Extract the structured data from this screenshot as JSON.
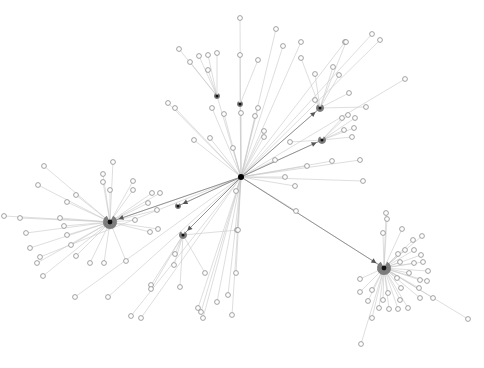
{
  "graph": {
    "title": "",
    "width": 484,
    "height": 368,
    "colors": {
      "background": "#ffffff",
      "edge": "#c8c8c8",
      "edge_strong": "#8a8a8a",
      "leaf_stroke": "#8c8c8c",
      "hub_pie": "#7c7c7c",
      "root": "#000000"
    },
    "root": {
      "id": "root",
      "x": 241,
      "y": 177,
      "r": 3
    },
    "hubs": [
      {
        "id": "hub-west",
        "x": 110,
        "y": 222,
        "r": 7
      },
      {
        "id": "hub-southeast",
        "x": 384,
        "y": 268,
        "r": 7
      },
      {
        "id": "hub-northeast-1",
        "x": 320,
        "y": 108,
        "r": 4
      },
      {
        "id": "hub-northeast-2",
        "x": 322,
        "y": 140,
        "r": 4
      },
      {
        "id": "hub-south-1",
        "x": 183,
        "y": 235,
        "r": 4
      },
      {
        "id": "hub-mid-west",
        "x": 178,
        "y": 206,
        "r": 3
      },
      {
        "id": "hub-north-1",
        "x": 217,
        "y": 96,
        "r": 3
      },
      {
        "id": "hub-north-2",
        "x": 240,
        "y": 104,
        "r": 3
      }
    ],
    "strong_edges": [
      {
        "from": "root",
        "to": "hub-west"
      },
      {
        "from": "root",
        "to": "hub-southeast"
      },
      {
        "from": "root",
        "to": "hub-northeast-1"
      },
      {
        "from": "root",
        "to": "hub-northeast-2"
      },
      {
        "from": "root",
        "to": "hub-south-1"
      },
      {
        "from": "root",
        "to": "hub-mid-west"
      }
    ],
    "leaves": [
      {
        "x": 240,
        "y": 18,
        "p": "root"
      },
      {
        "x": 276,
        "y": 29,
        "p": "root"
      },
      {
        "x": 345,
        "y": 42,
        "p": "root"
      },
      {
        "x": 372,
        "y": 34,
        "p": "root"
      },
      {
        "x": 380,
        "y": 40,
        "p": "root"
      },
      {
        "x": 179,
        "y": 49,
        "p": "hub-north-1"
      },
      {
        "x": 199,
        "y": 56,
        "p": "hub-north-1"
      },
      {
        "x": 208,
        "y": 55,
        "p": "hub-north-1"
      },
      {
        "x": 217,
        "y": 53,
        "p": "hub-north-1"
      },
      {
        "x": 240,
        "y": 55,
        "p": "hub-north-2"
      },
      {
        "x": 258,
        "y": 60,
        "p": "hub-north-2"
      },
      {
        "x": 190,
        "y": 62,
        "p": "hub-north-1"
      },
      {
        "x": 208,
        "y": 70,
        "p": "hub-north-1"
      },
      {
        "x": 346,
        "y": 42,
        "p": "hub-northeast-1"
      },
      {
        "x": 301,
        "y": 58,
        "p": "hub-northeast-1"
      },
      {
        "x": 315,
        "y": 74,
        "p": "hub-northeast-1"
      },
      {
        "x": 333,
        "y": 67,
        "p": "hub-northeast-1"
      },
      {
        "x": 339,
        "y": 75,
        "p": "hub-northeast-1"
      },
      {
        "x": 315,
        "y": 100,
        "p": "hub-northeast-1"
      },
      {
        "x": 349,
        "y": 93,
        "p": "hub-northeast-1"
      },
      {
        "x": 366,
        "y": 107,
        "p": "hub-northeast-1"
      },
      {
        "x": 348,
        "y": 115,
        "p": "hub-northeast-2"
      },
      {
        "x": 342,
        "y": 118,
        "p": "hub-northeast-2"
      },
      {
        "x": 355,
        "y": 118,
        "p": "hub-northeast-2"
      },
      {
        "x": 354,
        "y": 128,
        "p": "hub-northeast-2"
      },
      {
        "x": 344,
        "y": 130,
        "p": "hub-northeast-2"
      },
      {
        "x": 352,
        "y": 137,
        "p": "hub-northeast-2"
      },
      {
        "x": 290,
        "y": 142,
        "p": "hub-northeast-2"
      },
      {
        "x": 264,
        "y": 137,
        "p": "root"
      },
      {
        "x": 283,
        "y": 46,
        "p": "root"
      },
      {
        "x": 301,
        "y": 42,
        "p": "root"
      },
      {
        "x": 168,
        "y": 103,
        "p": "root"
      },
      {
        "x": 175,
        "y": 108,
        "p": "root"
      },
      {
        "x": 224,
        "y": 114,
        "p": "root"
      },
      {
        "x": 212,
        "y": 108,
        "p": "root"
      },
      {
        "x": 241,
        "y": 113,
        "p": "root"
      },
      {
        "x": 255,
        "y": 116,
        "p": "root"
      },
      {
        "x": 258,
        "y": 108,
        "p": "root"
      },
      {
        "x": 194,
        "y": 140,
        "p": "root"
      },
      {
        "x": 210,
        "y": 138,
        "p": "root"
      },
      {
        "x": 233,
        "y": 148,
        "p": "root"
      },
      {
        "x": 264,
        "y": 131,
        "p": "root"
      },
      {
        "x": 275,
        "y": 160,
        "p": "root"
      },
      {
        "x": 285,
        "y": 177,
        "p": "root"
      },
      {
        "x": 307,
        "y": 166,
        "p": "root"
      },
      {
        "x": 332,
        "y": 161,
        "p": "root"
      },
      {
        "x": 360,
        "y": 160,
        "p": "root"
      },
      {
        "x": 363,
        "y": 181,
        "p": "root"
      },
      {
        "x": 296,
        "y": 211,
        "p": "root"
      },
      {
        "x": 236,
        "y": 191,
        "p": "root"
      },
      {
        "x": 237,
        "y": 230,
        "p": "root"
      },
      {
        "x": 295,
        "y": 186,
        "p": "root"
      },
      {
        "x": 405,
        "y": 79,
        "p": "root"
      },
      {
        "x": 44,
        "y": 166,
        "p": "hub-west"
      },
      {
        "x": 103,
        "y": 174,
        "p": "hub-west"
      },
      {
        "x": 103,
        "y": 182,
        "p": "hub-west"
      },
      {
        "x": 110,
        "y": 190,
        "p": "hub-west"
      },
      {
        "x": 76,
        "y": 195,
        "p": "hub-west"
      },
      {
        "x": 67,
        "y": 202,
        "p": "hub-west"
      },
      {
        "x": 60,
        "y": 218,
        "p": "hub-west"
      },
      {
        "x": 64,
        "y": 226,
        "p": "hub-west"
      },
      {
        "x": 67,
        "y": 235,
        "p": "hub-west"
      },
      {
        "x": 71,
        "y": 245,
        "p": "hub-west"
      },
      {
        "x": 76,
        "y": 256,
        "p": "hub-west"
      },
      {
        "x": 90,
        "y": 263,
        "p": "hub-west"
      },
      {
        "x": 104,
        "y": 263,
        "p": "hub-west"
      },
      {
        "x": 126,
        "y": 261,
        "p": "hub-west"
      },
      {
        "x": 38,
        "y": 185,
        "p": "hub-west"
      },
      {
        "x": 20,
        "y": 218,
        "p": "hub-west"
      },
      {
        "x": 26,
        "y": 233,
        "p": "hub-west"
      },
      {
        "x": 30,
        "y": 248,
        "p": "hub-west"
      },
      {
        "x": 37,
        "y": 263,
        "p": "hub-west"
      },
      {
        "x": 43,
        "y": 276,
        "p": "hub-west"
      },
      {
        "x": 113,
        "y": 162,
        "p": "hub-west"
      },
      {
        "x": 133,
        "y": 190,
        "p": "hub-west"
      },
      {
        "x": 148,
        "y": 203,
        "p": "hub-west"
      },
      {
        "x": 157,
        "y": 210,
        "p": "hub-west"
      },
      {
        "x": 135,
        "y": 220,
        "p": "hub-west"
      },
      {
        "x": 150,
        "y": 232,
        "p": "hub-west"
      },
      {
        "x": 158,
        "y": 229,
        "p": "hub-west"
      },
      {
        "x": 133,
        "y": 181,
        "p": "hub-west"
      },
      {
        "x": 152,
        "y": 193,
        "p": "hub-west"
      },
      {
        "x": 160,
        "y": 193,
        "p": "hub-west"
      },
      {
        "x": 4,
        "y": 216,
        "p": "hub-west"
      },
      {
        "x": 175,
        "y": 254,
        "p": "hub-south-1"
      },
      {
        "x": 174,
        "y": 265,
        "p": "hub-south-1"
      },
      {
        "x": 151,
        "y": 285,
        "p": "hub-south-1"
      },
      {
        "x": 151,
        "y": 289,
        "p": "hub-south-1"
      },
      {
        "x": 180,
        "y": 287,
        "p": "hub-south-1"
      },
      {
        "x": 205,
        "y": 273,
        "p": "hub-south-1"
      },
      {
        "x": 238,
        "y": 230,
        "p": "hub-south-1"
      },
      {
        "x": 236,
        "y": 273,
        "p": "root"
      },
      {
        "x": 228,
        "y": 295,
        "p": "root"
      },
      {
        "x": 217,
        "y": 302,
        "p": "root"
      },
      {
        "x": 232,
        "y": 315,
        "p": "root"
      },
      {
        "x": 198,
        "y": 308,
        "p": "root"
      },
      {
        "x": 141,
        "y": 318,
        "p": "root"
      },
      {
        "x": 131,
        "y": 316,
        "p": "root"
      },
      {
        "x": 40,
        "y": 257,
        "p": "root"
      },
      {
        "x": 75,
        "y": 297,
        "p": "root"
      },
      {
        "x": 108,
        "y": 297,
        "p": "root"
      },
      {
        "x": 201,
        "y": 312,
        "p": "root"
      },
      {
        "x": 203,
        "y": 318,
        "p": "root"
      },
      {
        "x": 383,
        "y": 233,
        "p": "hub-southeast"
      },
      {
        "x": 387,
        "y": 219,
        "p": "hub-southeast"
      },
      {
        "x": 402,
        "y": 229,
        "p": "hub-southeast"
      },
      {
        "x": 398,
        "y": 254,
        "p": "hub-southeast"
      },
      {
        "x": 405,
        "y": 250,
        "p": "hub-southeast"
      },
      {
        "x": 414,
        "y": 250,
        "p": "hub-southeast"
      },
      {
        "x": 421,
        "y": 255,
        "p": "hub-southeast"
      },
      {
        "x": 400,
        "y": 262,
        "p": "hub-southeast"
      },
      {
        "x": 414,
        "y": 263,
        "p": "hub-southeast"
      },
      {
        "x": 423,
        "y": 262,
        "p": "hub-southeast"
      },
      {
        "x": 428,
        "y": 271,
        "p": "hub-southeast"
      },
      {
        "x": 409,
        "y": 273,
        "p": "hub-southeast"
      },
      {
        "x": 420,
        "y": 280,
        "p": "hub-southeast"
      },
      {
        "x": 427,
        "y": 281,
        "p": "hub-southeast"
      },
      {
        "x": 397,
        "y": 278,
        "p": "hub-southeast"
      },
      {
        "x": 401,
        "y": 288,
        "p": "hub-southeast"
      },
      {
        "x": 419,
        "y": 288,
        "p": "hub-southeast"
      },
      {
        "x": 360,
        "y": 279,
        "p": "hub-southeast"
      },
      {
        "x": 360,
        "y": 292,
        "p": "hub-southeast"
      },
      {
        "x": 372,
        "y": 290,
        "p": "hub-southeast"
      },
      {
        "x": 388,
        "y": 293,
        "p": "hub-southeast"
      },
      {
        "x": 368,
        "y": 301,
        "p": "hub-southeast"
      },
      {
        "x": 383,
        "y": 300,
        "p": "hub-southeast"
      },
      {
        "x": 400,
        "y": 300,
        "p": "hub-southeast"
      },
      {
        "x": 420,
        "y": 298,
        "p": "hub-southeast"
      },
      {
        "x": 433,
        "y": 298,
        "p": "hub-southeast"
      },
      {
        "x": 379,
        "y": 308,
        "p": "hub-southeast"
      },
      {
        "x": 389,
        "y": 309,
        "p": "hub-southeast"
      },
      {
        "x": 398,
        "y": 309,
        "p": "hub-southeast"
      },
      {
        "x": 408,
        "y": 308,
        "p": "hub-southeast"
      },
      {
        "x": 372,
        "y": 318,
        "p": "hub-southeast"
      },
      {
        "x": 386,
        "y": 213,
        "p": "hub-southeast"
      },
      {
        "x": 468,
        "y": 319,
        "p": "hub-southeast"
      },
      {
        "x": 361,
        "y": 344,
        "p": "hub-southeast"
      },
      {
        "x": 413,
        "y": 240,
        "p": "hub-southeast"
      },
      {
        "x": 422,
        "y": 236,
        "p": "hub-southeast"
      }
    ]
  }
}
